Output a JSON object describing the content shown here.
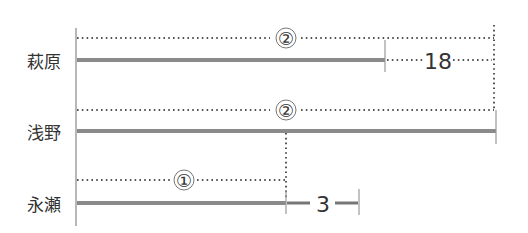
{
  "diagram": {
    "type": "line-segment comparison",
    "rows": [
      {
        "name": "萩原",
        "bar_label": "②",
        "difference_label": "18"
      },
      {
        "name": "浅野",
        "bar_label": "②"
      },
      {
        "name": "永瀬",
        "bar_label": "①",
        "difference_label": "3"
      }
    ],
    "colors": {
      "bar": "#8a8a8a",
      "dotted": "#555555",
      "text": "#333333",
      "axis": "#888888"
    }
  }
}
